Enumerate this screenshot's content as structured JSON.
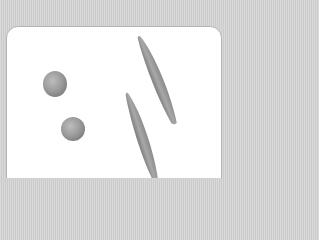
{
  "scene": {
    "description": "Grayscale illustration of two round cells and two elongated spindle-shaped cells on a white rounded panel",
    "colors": {
      "background": "#d3d3d3",
      "panel": "#ffffff",
      "panel_border": "#b4b4b4",
      "shape_light": "#bdbdbd",
      "shape_mid": "#9a9a9a",
      "shape_dark": "#7a7a7a"
    },
    "shapes": [
      {
        "type": "sphere",
        "cx": 55,
        "cy": 84,
        "rx": 12,
        "ry": 13
      },
      {
        "type": "sphere",
        "cx": 73,
        "cy": 129,
        "rx": 12,
        "ry": 12
      },
      {
        "type": "spindle",
        "x1": 140,
        "y1": 36,
        "x2": 175,
        "y2": 124,
        "width": 10
      },
      {
        "type": "spindle",
        "x1": 128,
        "y1": 93,
        "x2": 156,
        "y2": 182,
        "width": 10
      }
    ]
  }
}
